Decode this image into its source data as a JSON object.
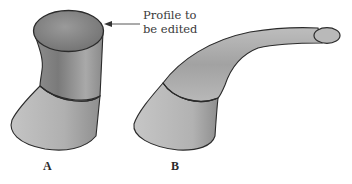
{
  "figure": {
    "callout": {
      "line1": "Profile to",
      "line2": "be edited"
    },
    "labels": {
      "a": "A",
      "b": "B"
    },
    "colors": {
      "stroke": "#2b2b2b",
      "surface_light": "#c9c9c9",
      "surface_mid": "#a8a8a8",
      "surface_dark": "#777777",
      "background": "#ffffff"
    }
  }
}
